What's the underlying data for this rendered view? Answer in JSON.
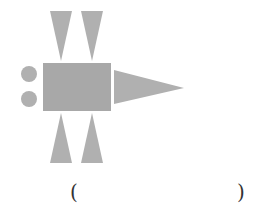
{
  "figure": {
    "fill_color": "#b0b0b0",
    "rect_color": "#a8a8a8",
    "shapes": {
      "rectangle": {
        "x": 43,
        "y": 63,
        "w": 68,
        "h": 48
      },
      "circles": [
        {
          "cx": 29,
          "cy": 74,
          "r": 8
        },
        {
          "cx": 29,
          "cy": 99,
          "r": 8
        }
      ],
      "top_triangles": [
        {
          "points": "50,11 72,11 61,61"
        },
        {
          "points": "81,11 103,11 92,61"
        }
      ],
      "bottom_triangles": [
        {
          "points": "61,113 50,163 72,163"
        },
        {
          "points": "92,113 81,163 103,163"
        }
      ],
      "right_triangle": {
        "points": "114,70 114,104 184,88"
      }
    }
  },
  "answer": {
    "open_paren": "(",
    "close_paren": ")",
    "value": ""
  }
}
